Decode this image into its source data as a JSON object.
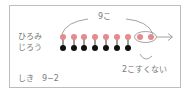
{
  "diagram": {
    "total_label": "9こ",
    "rows": [
      {
        "name": "ひろみ",
        "count": 9,
        "color": "#e58a8f"
      },
      {
        "name": "じろう",
        "count": 7,
        "color": "#111111"
      }
    ],
    "difference_label": "2こすくない",
    "formula_label": "しき　9−2",
    "accent_color": "#e58a8f",
    "line_color": "#8a8a8a"
  }
}
